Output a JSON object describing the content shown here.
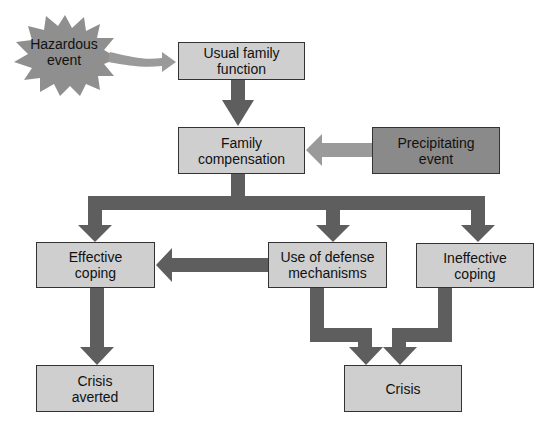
{
  "diagram": {
    "type": "flowchart",
    "colors": {
      "box_fill": "#cfcfcf",
      "precipitating_fill": "#8a8a8a",
      "arrow_dark": "#5e5e5e",
      "arrow_light": "#9a9a9a",
      "burst_fill": "#8f8f8f"
    },
    "nodes": {
      "hazardous_event": "Hazardous\nevent",
      "usual_family_function": "Usual family\nfunction",
      "family_compensation": "Family\ncompensation",
      "precipitating_event": "Precipitating\nevent",
      "effective_coping": "Effective\ncoping",
      "use_of_defense": "Use of defense\nmechanisms",
      "ineffective_coping": "Ineffective\ncoping",
      "crisis_averted": "Crisis\naverted",
      "crisis": "Crisis"
    },
    "edges": [
      {
        "from": "Hazardous event",
        "to": "Usual family function"
      },
      {
        "from": "Usual family function",
        "to": "Family compensation"
      },
      {
        "from": "Precipitating event",
        "to": "Family compensation"
      },
      {
        "from": "Family compensation",
        "to": "Effective coping"
      },
      {
        "from": "Family compensation",
        "to": "Use of defense mechanisms"
      },
      {
        "from": "Family compensation",
        "to": "Ineffective coping"
      },
      {
        "from": "Use of defense mechanisms",
        "to": "Effective coping"
      },
      {
        "from": "Effective coping",
        "to": "Crisis averted"
      },
      {
        "from": "Use of defense mechanisms",
        "to": "Crisis"
      },
      {
        "from": "Ineffective coping",
        "to": "Crisis"
      }
    ]
  }
}
